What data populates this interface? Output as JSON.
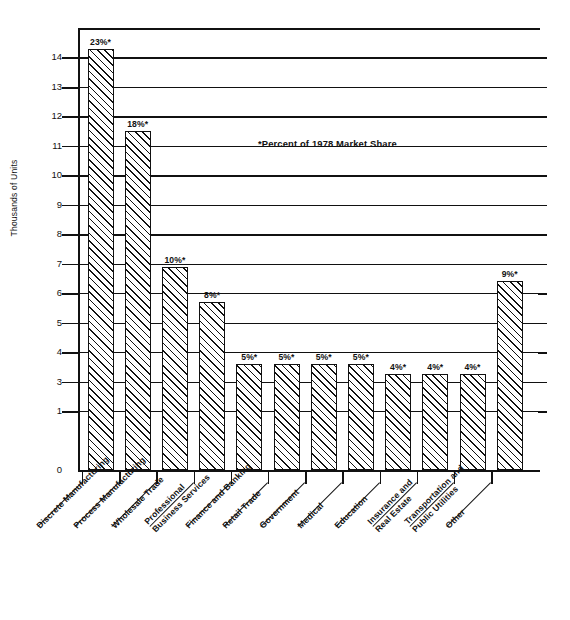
{
  "chart_data": {
    "type": "bar",
    "title": "",
    "xlabel": "",
    "ylabel": "Thousands of Units",
    "ylim": [
      0,
      15
    ],
    "grid": true,
    "legend": null,
    "annotation": "*Percent of 1978 Market Share",
    "ytick_labels": [
      "14",
      "13",
      "12",
      "11",
      "10",
      "9",
      "8",
      "7",
      "6",
      "5",
      "4",
      "3",
      "1",
      "0"
    ],
    "ytick_values": [
      14,
      13,
      12,
      11,
      10,
      9,
      8,
      7,
      6,
      5,
      4,
      3,
      2,
      0
    ],
    "categories": [
      "Discrete Manufacturing",
      "Process Manufacturing",
      "Wholesale Trade",
      "Professional Business Services",
      "Finance and Banking",
      "Retail Trade",
      "Government",
      "Medical",
      "Education",
      "Insurance and Real Estate",
      "Transportation and Public Utilities",
      "Other"
    ],
    "category_lines": [
      [
        "Discrete Manufacturing"
      ],
      [
        "Process Manufacturing"
      ],
      [
        "Wholesale Trade"
      ],
      [
        "Professional",
        "Business Services"
      ],
      [
        "Finance and Banking"
      ],
      [
        "Retail Trade"
      ],
      [
        "Government"
      ],
      [
        "Medical"
      ],
      [
        "Education"
      ],
      [
        "Insurance and",
        "Real Estate"
      ],
      [
        "Transportation and",
        "Public Utilities"
      ],
      [
        "Other"
      ]
    ],
    "values": [
      14.3,
      11.5,
      6.9,
      5.7,
      3.6,
      3.6,
      3.6,
      3.6,
      3.25,
      3.25,
      3.25,
      6.4
    ],
    "data_labels": [
      "23%*",
      "18%*",
      "10%*",
      "8%*",
      "5%*",
      "5%*",
      "5%*",
      "5%*",
      "4%*",
      "4%*",
      "4%*",
      "9%*"
    ],
    "market_share_percent": [
      23,
      18,
      10,
      8,
      5,
      5,
      5,
      5,
      4,
      4,
      4,
      9
    ]
  },
  "style": {
    "bar_fill": "#ffffff",
    "bar_edge": "#111111",
    "hatch": "diagonal-45",
    "axis_color": "#111111",
    "background": "#ffffff"
  }
}
